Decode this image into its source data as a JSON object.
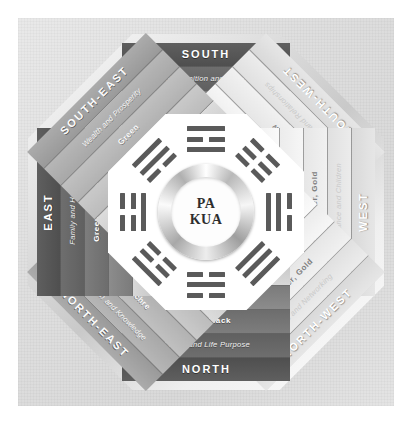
{
  "title": "PA KUA",
  "center": {
    "line1": "PA",
    "line2": "KUA"
  },
  "colors": {
    "page_background": "#ffffff",
    "panel_background": "#e0e0e0",
    "dark_band": "#5f5f5f",
    "mid_band": "#ababab",
    "light_band": "#e6e6e6",
    "trigram_stroke": "#5a5a5a",
    "center_ring": "#b9b9b9"
  },
  "sectors": [
    {
      "id": "south",
      "direction": "SOUTH",
      "aspiration": "Recognition and Fame",
      "color": "Red",
      "element": "FIRE",
      "trigram": "LI",
      "trigram_lines": [
        "solid",
        "broken",
        "solid"
      ],
      "tone": "dark"
    },
    {
      "id": "south-west",
      "direction": "SOUTH-WEST",
      "aspiration": "Marriage and Relationships",
      "color": "Yellow",
      "element": "BIG EARTH",
      "trigram": "KUN",
      "trigram_lines": [
        "broken",
        "broken",
        "broken"
      ],
      "tone": "light"
    },
    {
      "id": "west",
      "direction": "WEST",
      "aspiration": "Descendance and Children",
      "color": "White, Silver, Gold",
      "element": "SMALL METAL",
      "trigram": "TUI",
      "trigram_lines": [
        "broken",
        "solid",
        "solid"
      ],
      "tone": "light"
    },
    {
      "id": "north-west",
      "direction": "NORTH-WEST",
      "aspiration": "Mentors and Networking",
      "color": "White, Silver, Gold",
      "element": "BIG METAL",
      "trigram": "CHIEN",
      "trigram_lines": [
        "solid",
        "solid",
        "solid"
      ],
      "tone": "light"
    },
    {
      "id": "north",
      "direction": "NORTH",
      "aspiration": "Career and Life Purpose",
      "color": "Blue, Black",
      "element": "WATER",
      "trigram": "KAN",
      "trigram_lines": [
        "broken",
        "solid",
        "broken"
      ],
      "tone": "dark"
    },
    {
      "id": "north-east",
      "direction": "NORTH-EAST",
      "aspiration": "Education and Knowledge",
      "color": "Beige, Ochre",
      "element": "SMALL EARTH",
      "trigram": "KEN",
      "trigram_lines": [
        "solid",
        "broken",
        "broken"
      ],
      "tone": "mid"
    },
    {
      "id": "east",
      "direction": "EAST",
      "aspiration": "Family and Health",
      "color": "Green, Brown",
      "element": "BIG WOOD",
      "trigram": "CHEN",
      "trigram_lines": [
        "broken",
        "broken",
        "solid"
      ],
      "tone": "dark"
    },
    {
      "id": "south-east",
      "direction": "SOUTH-EAST",
      "aspiration": "Wealth and Prosperity",
      "color": "Green",
      "element": "SMALL WOOD",
      "trigram": "SUN",
      "trigram_lines": [
        "solid",
        "solid",
        "broken"
      ],
      "tone": "mid"
    }
  ]
}
